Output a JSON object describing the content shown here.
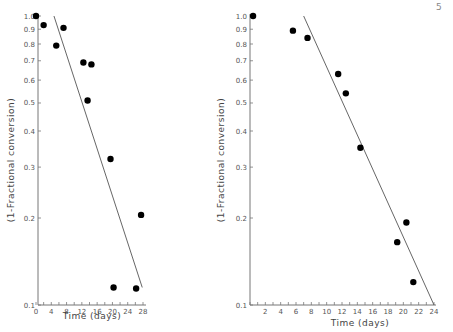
{
  "page": {
    "corner_mark": "5"
  },
  "chart_data": [
    {
      "type": "scatter",
      "title": "",
      "xlabel": "Time (days)",
      "ylabel": "(1-Fractional conversion)",
      "yscale": "log",
      "xlim": [
        0,
        28
      ],
      "ylim": [
        0.1,
        1.0
      ],
      "xticks": [
        0,
        4,
        8,
        12,
        16,
        20,
        24,
        28
      ],
      "yticks": [
        0.1,
        0.2,
        0.3,
        0.4,
        0.5,
        0.6,
        0.7,
        0.8,
        0.9,
        1.0
      ],
      "ytick_labels": [
        "0.1",
        "0.2",
        "0.3",
        "0.4",
        "0.5",
        "0.6",
        "0.7",
        "0.8",
        "0.9",
        "1.0"
      ],
      "grid": false,
      "legend": null,
      "points": [
        {
          "x": 0,
          "y": 1.0
        },
        {
          "x": 2,
          "y": 0.93
        },
        {
          "x": 5.3,
          "y": 0.79
        },
        {
          "x": 7.2,
          "y": 0.91
        },
        {
          "x": 12.4,
          "y": 0.69
        },
        {
          "x": 14.5,
          "y": 0.68
        },
        {
          "x": 13.5,
          "y": 0.51
        },
        {
          "x": 19.5,
          "y": 0.32
        },
        {
          "x": 27.5,
          "y": 0.205
        },
        {
          "x": 20.3,
          "y": 0.115
        },
        {
          "x": 26.2,
          "y": 0.114
        }
      ],
      "fit_line": {
        "x": [
          4.7,
          27.8
        ],
        "y": [
          1.0,
          0.115
        ]
      }
    },
    {
      "type": "scatter",
      "title": "",
      "xlabel": "Time (days)",
      "ylabel": "(1-Fractional conversion)",
      "yscale": "log",
      "xlim": [
        0,
        24
      ],
      "ylim": [
        0.1,
        1.0
      ],
      "xticks": [
        2,
        4,
        6,
        8,
        10,
        12,
        14,
        16,
        18,
        20,
        22,
        24
      ],
      "yticks": [
        0.1,
        0.2,
        0.3,
        0.4,
        0.5,
        0.6,
        0.7,
        0.8,
        0.9,
        1.0
      ],
      "ytick_labels": [
        "0.1",
        "0.2",
        "0.3",
        "0.4",
        "0.5",
        "0.6",
        "0.7",
        "0.8",
        "0.9",
        "1.0"
      ],
      "grid": false,
      "legend": null,
      "points": [
        {
          "x": 0.4,
          "y": 1.0
        },
        {
          "x": 5.6,
          "y": 0.89
        },
        {
          "x": 7.5,
          "y": 0.84
        },
        {
          "x": 11.5,
          "y": 0.63
        },
        {
          "x": 12.5,
          "y": 0.54
        },
        {
          "x": 14.4,
          "y": 0.35
        },
        {
          "x": 20.4,
          "y": 0.193
        },
        {
          "x": 19.2,
          "y": 0.165
        },
        {
          "x": 21.3,
          "y": 0.12
        }
      ],
      "fit_line": {
        "x": [
          7.0,
          24.0
        ],
        "y": [
          1.0,
          0.1
        ]
      }
    }
  ]
}
